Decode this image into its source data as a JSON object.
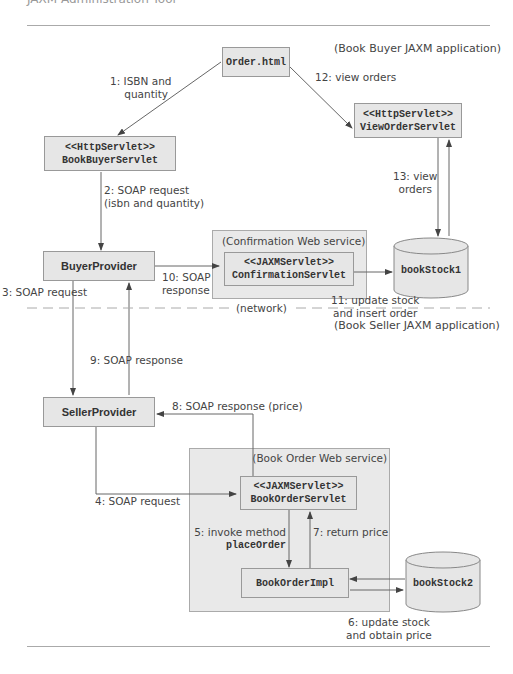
{
  "header": {
    "clipped_title": "JAXM Administration Tool"
  },
  "regions": {
    "buyer_app": "(Book Buyer JAXM application)",
    "network": "(network)",
    "seller_app": "(Book Seller JAXM application)",
    "confirmation_service": "(Confirmation Web service)",
    "book_order_service": "(Book Order Web service)"
  },
  "nodes": {
    "order_html": {
      "name": "Order.html"
    },
    "view_order_servlet": {
      "stereotype": "<<HttpServlet>>",
      "name": "ViewOrderServlet"
    },
    "book_buyer_servlet": {
      "stereotype": "<<HttpServlet>>",
      "name": "BookBuyerServlet"
    },
    "buyer_provider": {
      "name": "BuyerProvider"
    },
    "confirmation_servlet": {
      "stereotype": "<<JAXMServlet>>",
      "name": "ConfirmationServlet"
    },
    "book_stock1": {
      "name": "bookStock1"
    },
    "seller_provider": {
      "name": "SellerProvider"
    },
    "book_order_servlet": {
      "stereotype": "<<JAXMServlet>>",
      "name": "BookOrderServlet"
    },
    "book_order_impl": {
      "name": "BookOrderImpl"
    },
    "book_stock2": {
      "name": "bookStock2"
    }
  },
  "edges": {
    "e1": {
      "line1": "1: ISBN and",
      "line2": "quantity"
    },
    "e2": {
      "line1": "2: SOAP request",
      "line2": "(isbn and quantity)"
    },
    "e3": {
      "label": "3: SOAP request"
    },
    "e4": {
      "label": "4: SOAP request"
    },
    "e5": {
      "line1": "5: invoke method",
      "line2": "placeOrder"
    },
    "e6": {
      "line1": "6: update stock",
      "line2": "and obtain price"
    },
    "e7": {
      "label": "7: return price"
    },
    "e8": {
      "label": "8: SOAP response (price)"
    },
    "e9": {
      "label": "9: SOAP response"
    },
    "e10": {
      "line1": "10: SOAP",
      "line2": "response"
    },
    "e11": {
      "line1": "11: update stock",
      "line2": "and insert order"
    },
    "e12": {
      "label": "12: view orders"
    },
    "e13": {
      "line1": "13: view",
      "line2": "orders"
    }
  }
}
